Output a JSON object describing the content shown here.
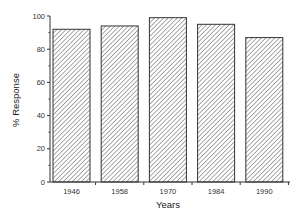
{
  "chart_data": {
    "type": "bar",
    "title": "",
    "xlabel": "Years",
    "ylabel": "% Response",
    "categories": [
      "1946",
      "1958",
      "1970",
      "1984",
      "1990"
    ],
    "values": [
      92,
      94,
      99,
      95,
      87
    ],
    "ylim": [
      0,
      100
    ],
    "yticks": [
      0,
      20,
      40,
      60,
      80,
      100
    ],
    "grid": false,
    "legend": null,
    "bar_fill": "diagonal-hatch",
    "colors": {
      "bar_stroke": "#333333",
      "hatch": "#555555",
      "background": "#ffffff"
    }
  }
}
